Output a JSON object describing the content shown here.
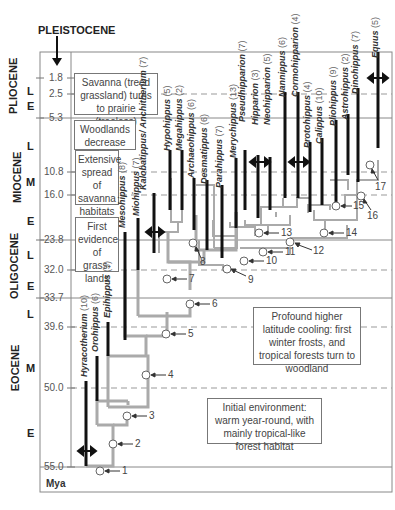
{
  "header": {
    "pleistocene_label": "PLEISTOCENE"
  },
  "epochs": [
    {
      "name": "PLIOCENE",
      "subdivisions": [
        "L",
        "E"
      ]
    },
    {
      "name": "MIOCENE",
      "subdivisions": [
        "L",
        "M",
        "E"
      ]
    },
    {
      "name": "OLIGOCENE",
      "subdivisions": [
        "L",
        "E"
      ]
    },
    {
      "name": "EOCENE",
      "subdivisions": [
        "L",
        "M",
        "E"
      ]
    }
  ],
  "time_ticks": [
    "1.8",
    "2.5",
    "5.3",
    "10.8",
    "16.0",
    "23.8",
    "32.0",
    "33.7",
    "39.6",
    "50.0",
    "55.0"
  ],
  "axis_unit": "Mya",
  "environment_notes": [
    "Savanna (treed grassland) turns to prairie (treeless)",
    "Woodlands decrease",
    "Extensive spread of savanna habitats",
    "First evidence of grass-lands",
    "Profound higher latitude cooling: first winter frosts, and tropical forests turn to woodland",
    "Initial environment: warm year-round, with mainly tropical-like forest habitat"
  ],
  "genera": [
    {
      "name": "Hyracotherium",
      "count": "(10)"
    },
    {
      "name": "Orohippus",
      "count": "(6)"
    },
    {
      "name": "Epihippus",
      "count": "(3)"
    },
    {
      "name": "Mesohippus",
      "count": "(8)"
    },
    {
      "name": "Miohippus",
      "count": "(7)"
    },
    {
      "name": "Kalobatippus/ Anchitherium",
      "count": "(7)"
    },
    {
      "name": "Hypohippus",
      "count": "(5)"
    },
    {
      "name": "Megahippus",
      "count": "(2)"
    },
    {
      "name": "Archaeohippus",
      "count": "(6)"
    },
    {
      "name": "Desmatippus",
      "count": "(6)"
    },
    {
      "name": "Parahippus",
      "count": "(7)"
    },
    {
      "name": "Merychippus",
      "count": "(13)"
    },
    {
      "name": "Pseudhipparion",
      "count": "(7)"
    },
    {
      "name": "Hipparion",
      "count": "(3)"
    },
    {
      "name": "Neohipparion",
      "count": "(5)"
    },
    {
      "name": "Nannippus",
      "count": "(6)"
    },
    {
      "name": "Cormohipparion",
      "count": "(4)"
    },
    {
      "name": "Protohippus",
      "count": "(4)"
    },
    {
      "name": "Calippus",
      "count": "(10)"
    },
    {
      "name": "Pliohippus",
      "count": "(9)"
    },
    {
      "name": "Astrohippus",
      "count": "(2)"
    },
    {
      "name": "Dinohippus",
      "count": "(7)"
    },
    {
      "name": "Equus",
      "count": "(5)"
    }
  ],
  "nodes": [
    "1",
    "2",
    "3",
    "4",
    "5",
    "6",
    "7",
    "8",
    "9",
    "10",
    "11",
    "12",
    "13",
    "14",
    "15",
    "16",
    "17"
  ]
}
